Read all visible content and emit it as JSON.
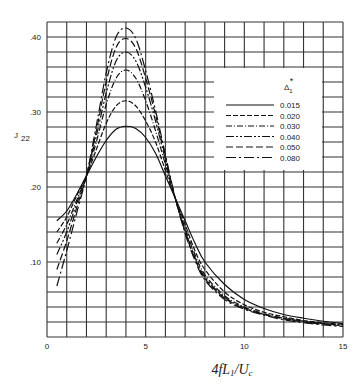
{
  "chart_data": {
    "type": "line",
    "title": "",
    "xlabel": "4fL1/Uc",
    "ylabel": "J22",
    "xlim": [
      0,
      15
    ],
    "ylim": [
      0,
      0.42
    ],
    "grid": true,
    "x_ticks": [
      "0",
      "5",
      "10",
      "15"
    ],
    "y_ticks": [
      ".10",
      ".20",
      ".30",
      ".40"
    ],
    "legend": {
      "title": "Δ1*",
      "position": "upper right",
      "entries": [
        "0.015",
        "0.020",
        "0.030",
        "0.040",
        "0.050",
        "0.080"
      ]
    },
    "series": [
      {
        "name": "0.015",
        "dash": "",
        "x": [
          0.5,
          1,
          1.5,
          2,
          2.5,
          3,
          3.5,
          4,
          4.5,
          5,
          5.5,
          6,
          6.5,
          7,
          7.5,
          8,
          9,
          10,
          11,
          12,
          13,
          14,
          15
        ],
        "values": [
          0.155,
          0.168,
          0.19,
          0.215,
          0.24,
          0.262,
          0.277,
          0.281,
          0.278,
          0.266,
          0.245,
          0.215,
          0.185,
          0.155,
          0.125,
          0.1,
          0.07,
          0.05,
          0.038,
          0.03,
          0.025,
          0.021,
          0.018
        ]
      },
      {
        "name": "0.020",
        "dash": "5,2",
        "x": [
          0.5,
          1,
          1.5,
          2,
          2.5,
          3,
          3.5,
          4,
          4.5,
          5,
          5.5,
          6,
          6.5,
          7,
          7.5,
          8,
          9,
          10,
          11,
          12,
          13,
          14,
          15
        ],
        "values": [
          0.14,
          0.16,
          0.188,
          0.215,
          0.25,
          0.285,
          0.308,
          0.315,
          0.308,
          0.288,
          0.26,
          0.222,
          0.185,
          0.15,
          0.115,
          0.09,
          0.06,
          0.043,
          0.033,
          0.027,
          0.022,
          0.019,
          0.017
        ]
      },
      {
        "name": "0.030",
        "dash": "6,2,1,2",
        "x": [
          0.5,
          1,
          1.5,
          2,
          2.5,
          3,
          3.5,
          4,
          4.5,
          5,
          5.5,
          6,
          6.5,
          7,
          7.5,
          8,
          9,
          10,
          11,
          12,
          13,
          14,
          15
        ],
        "values": [
          0.125,
          0.15,
          0.182,
          0.215,
          0.26,
          0.31,
          0.345,
          0.356,
          0.345,
          0.315,
          0.275,
          0.23,
          0.185,
          0.145,
          0.11,
          0.083,
          0.055,
          0.04,
          0.031,
          0.025,
          0.021,
          0.018,
          0.016
        ]
      },
      {
        "name": "0.040",
        "dash": "8,2,2,2,2,2",
        "x": [
          0.5,
          1,
          1.5,
          2,
          2.5,
          3,
          3.5,
          4,
          4.5,
          5,
          5.5,
          6,
          6.5,
          7,
          7.5,
          8,
          9,
          10,
          11,
          12,
          13,
          14,
          15
        ],
        "values": [
          0.11,
          0.14,
          0.178,
          0.215,
          0.268,
          0.325,
          0.368,
          0.38,
          0.368,
          0.333,
          0.288,
          0.236,
          0.185,
          0.142,
          0.106,
          0.08,
          0.053,
          0.039,
          0.03,
          0.025,
          0.021,
          0.018,
          0.016
        ]
      },
      {
        "name": "0.050",
        "dash": "7,3",
        "x": [
          0.5,
          1,
          1.5,
          2,
          2.5,
          3,
          3.5,
          4,
          4.5,
          5,
          5.5,
          6,
          6.5,
          7,
          7.5,
          8,
          9,
          10,
          11,
          12,
          13,
          14,
          15
        ],
        "values": [
          0.09,
          0.128,
          0.172,
          0.215,
          0.275,
          0.34,
          0.386,
          0.398,
          0.385,
          0.345,
          0.296,
          0.24,
          0.185,
          0.14,
          0.104,
          0.078,
          0.052,
          0.038,
          0.03,
          0.024,
          0.02,
          0.017,
          0.015
        ]
      },
      {
        "name": "0.080",
        "dash": "10,3,2,3",
        "x": [
          0.5,
          1,
          1.5,
          2,
          2.5,
          3,
          3.5,
          4,
          4.5,
          5,
          5.5,
          6,
          6.5,
          7,
          7.5,
          8,
          9,
          10,
          11,
          12,
          13,
          14,
          15
        ],
        "values": [
          0.068,
          0.115,
          0.165,
          0.215,
          0.282,
          0.352,
          0.4,
          0.412,
          0.398,
          0.355,
          0.302,
          0.243,
          0.185,
          0.138,
          0.102,
          0.076,
          0.05,
          0.037,
          0.029,
          0.023,
          0.019,
          0.016,
          0.014
        ]
      }
    ]
  }
}
